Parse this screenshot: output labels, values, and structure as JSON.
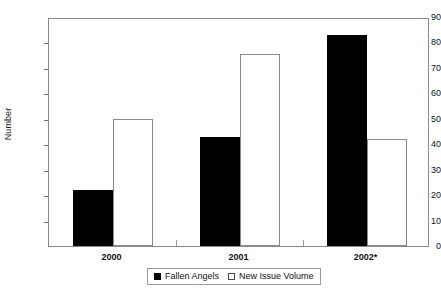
{
  "chart_data": {
    "type": "bar",
    "title": "",
    "subtitle": "",
    "xlabel": "",
    "ylabel": "Number",
    "ylim": [
      0,
      90
    ],
    "ytick_step": 10,
    "yticks": [
      0,
      10,
      20,
      30,
      40,
      50,
      60,
      70,
      80,
      90
    ],
    "ytick_labels": [
      "0",
      "10",
      "20",
      "30",
      "40",
      "50",
      "60",
      "70",
      "80",
      "90"
    ],
    "categories": [
      "2000",
      "2001",
      "2002*"
    ],
    "grid": false,
    "legend_position": "bottom",
    "series": [
      {
        "name": "Fallen Angels",
        "style": "filled",
        "color": "#000000",
        "values": [
          22,
          43,
          83
        ]
      },
      {
        "name": "New Issue Volume",
        "style": "open",
        "color": "#ffffff",
        "border_color": "#8a8a8a",
        "values": [
          50,
          75.5,
          42
        ]
      }
    ],
    "annotations": []
  },
  "legend": {
    "items": [
      {
        "label": "Fallen Angels",
        "marker": "filled-square-icon"
      },
      {
        "label": "New Issue Volume",
        "marker": "open-square-icon"
      }
    ]
  },
  "axis": {
    "y_title": "Number"
  }
}
